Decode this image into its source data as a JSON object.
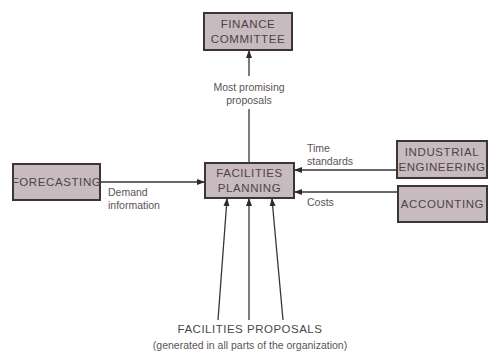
{
  "diagram": {
    "nodes": {
      "finance_committee": "FINANCE\nCOMMITTEE",
      "facilities_planning": "FACILITIES\nPLANNING",
      "forecasting": "FORECASTING",
      "industrial_engineering": "INDUSTRIAL\nENGINEERING",
      "accounting": "ACCOUNTING"
    },
    "edges": {
      "most_promising": "Most promising\nproposals",
      "demand_information": "Demand\ninformation",
      "time_standards": "Time\nstandards",
      "costs": "Costs"
    },
    "footer": {
      "title": "FACILITIES PROPOSALS",
      "subtitle": "(generated in all parts of the organization)"
    },
    "colors": {
      "box_fill": "#c8bbbf",
      "box_border": "#3c3538",
      "line": "#3a3436"
    }
  }
}
